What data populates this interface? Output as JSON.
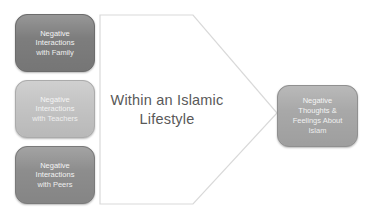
{
  "diagram": {
    "title": "Within an Islamic Lifestyle",
    "center_label": {
      "lines": [
        "Within an Islamic",
        "Lifestyle"
      ],
      "color": "#595959"
    },
    "left_boxes": [
      {
        "id": "family",
        "lines": [
          "Negative",
          "Interactions",
          "with Family"
        ],
        "fill": "#7d7d7d",
        "border": "#6c6c6c"
      },
      {
        "id": "teachers",
        "lines": [
          "Negative",
          "Interactions",
          "with Teachers"
        ],
        "fill": "#c4c4c4",
        "border": "#ababab"
      },
      {
        "id": "peers",
        "lines": [
          "Negative",
          "Interactions",
          "with Peers"
        ],
        "fill": "#8d8d8d",
        "border": "#7a7a7a"
      }
    ],
    "right_box": {
      "id": "islam",
      "lines": [
        "Negative",
        "Thoughts &",
        "Feelings About",
        "Islam"
      ],
      "fill": "#a8a8a8",
      "border": "#909090"
    },
    "shape": {
      "fill": "#ffffff",
      "stroke": "#d9d9d9"
    },
    "box_text_color": "#f4f4f4",
    "background": "#ffffff"
  }
}
